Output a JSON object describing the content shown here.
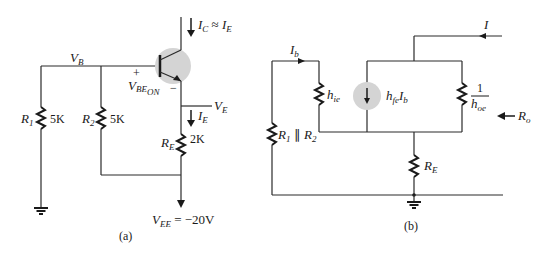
{
  "figure_a": {
    "caption": "(a)",
    "labels": {
      "vb": {
        "main": "V",
        "sub": "B"
      },
      "ic_ie": {
        "main1": "I",
        "sub1": "C",
        "approx": " ≈ ",
        "main2": "I",
        "sub2": "E"
      },
      "vbe_on": {
        "main": "V",
        "sub": "BE",
        "subsub": "ON"
      },
      "plus": "+",
      "minus": "−",
      "ve": {
        "main": "V",
        "sub": "E"
      },
      "ie": {
        "main": "I",
        "sub": "E"
      },
      "r1": {
        "main": "R",
        "sub": "1",
        "value": "5K"
      },
      "r2": {
        "main": "R",
        "sub": "2",
        "value": "5K"
      },
      "re": {
        "main": "R",
        "sub": "E",
        "value": "2K"
      },
      "vee": {
        "main": "V",
        "sub": "EE",
        "value": " = −20V"
      }
    }
  },
  "figure_b": {
    "caption": "(b)",
    "labels": {
      "ib": {
        "main": "I",
        "sub": "b"
      },
      "hie": {
        "main": "h",
        "sub": "ie"
      },
      "hfe_ib": {
        "main1": "h",
        "sub1": "fe",
        "main2": "I",
        "sub2": "b"
      },
      "hoe": {
        "num": "1",
        "main": "h",
        "sub": "oe"
      },
      "r1r2": {
        "main1": "R",
        "sub1": "1",
        "par": " ∥ ",
        "main2": "R",
        "sub2": "2"
      },
      "re": {
        "main": "R",
        "sub": "E"
      },
      "i": "I",
      "ro": {
        "main": "R",
        "sub": "o"
      }
    }
  },
  "colors": {
    "wire": "#2a2a2a",
    "highlight": "#d4d4d4",
    "background": "#ffffff"
  }
}
